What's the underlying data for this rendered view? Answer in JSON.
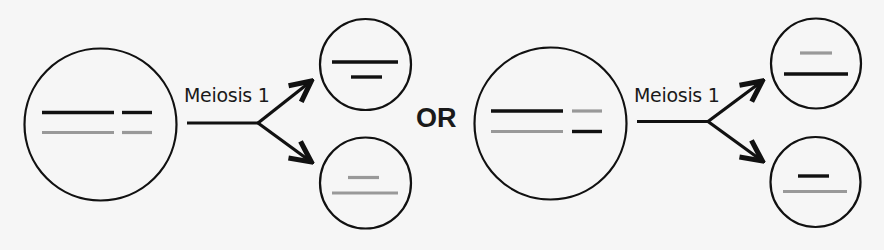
{
  "diagram": {
    "colors": {
      "background": "#f6f6f6",
      "outline": "#111111",
      "chromosome_dark": "#111111",
      "chromosome_light": "#999999"
    },
    "separator_label": "OR",
    "scenarios": [
      {
        "id": "scenario-1",
        "process_label": "Meiosis 1",
        "parent_cell": {
          "rows": [
            {
              "long": "dark",
              "short": "dark"
            },
            {
              "long": "light",
              "short": "light"
            }
          ]
        },
        "daughter_cells": [
          {
            "position": "top",
            "chromosomes": [
              {
                "length": "long",
                "shade": "dark"
              },
              {
                "length": "short",
                "shade": "dark"
              }
            ]
          },
          {
            "position": "bottom",
            "chromosomes": [
              {
                "length": "short",
                "shade": "light"
              },
              {
                "length": "long",
                "shade": "light"
              }
            ]
          }
        ]
      },
      {
        "id": "scenario-2",
        "process_label": "Meiosis 1",
        "parent_cell": {
          "rows": [
            {
              "long": "dark",
              "short": "light"
            },
            {
              "long": "light",
              "short": "dark"
            }
          ]
        },
        "daughter_cells": [
          {
            "position": "top",
            "chromosomes": [
              {
                "length": "short",
                "shade": "light"
              },
              {
                "length": "long",
                "shade": "dark"
              }
            ]
          },
          {
            "position": "bottom",
            "chromosomes": [
              {
                "length": "short",
                "shade": "dark"
              },
              {
                "length": "long",
                "shade": "light"
              }
            ]
          }
        ]
      }
    ]
  }
}
